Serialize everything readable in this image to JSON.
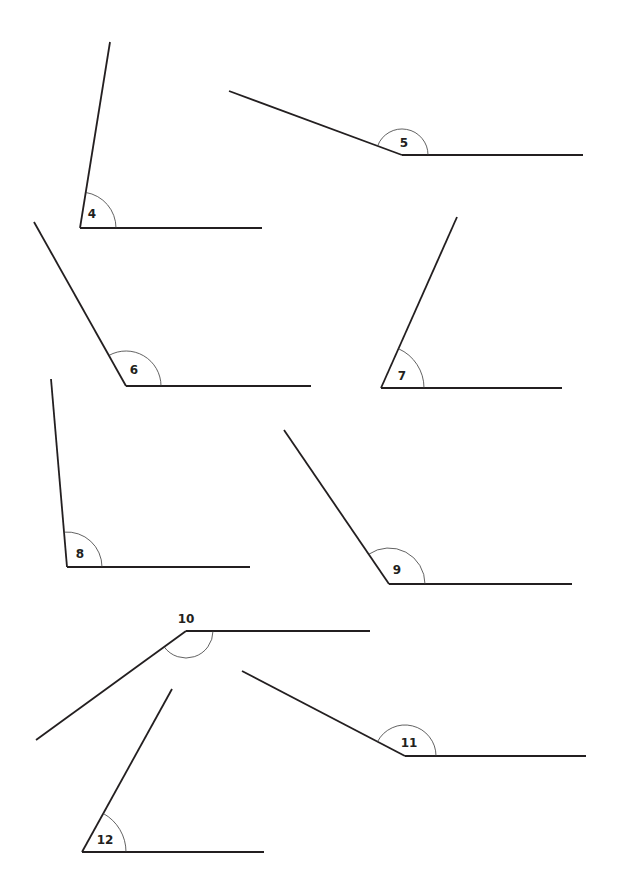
{
  "worksheet": {
    "angles": [
      {
        "label": "4",
        "vertex": [
          80,
          228
        ],
        "ray1_end": [
          110,
          42
        ],
        "ray2_end": [
          262,
          228
        ],
        "arc_radius": 36,
        "label_pos": [
          92,
          218
        ]
      },
      {
        "label": "5",
        "vertex": [
          402,
          155
        ],
        "ray1_end": [
          229,
          91
        ],
        "ray2_end": [
          583,
          155
        ],
        "arc_radius": 26,
        "label_pos": [
          404,
          147
        ]
      },
      {
        "label": "6",
        "vertex": [
          126,
          386
        ],
        "ray1_end": [
          34,
          222
        ],
        "ray2_end": [
          311,
          386
        ],
        "arc_radius": 35,
        "label_pos": [
          134,
          374
        ]
      },
      {
        "label": "7",
        "vertex": [
          381,
          388
        ],
        "ray1_end": [
          457,
          217
        ],
        "ray2_end": [
          562,
          388
        ],
        "arc_radius": 43,
        "label_pos": [
          402,
          380
        ]
      },
      {
        "label": "8",
        "vertex": [
          67,
          567
        ],
        "ray1_end": [
          51,
          379
        ],
        "ray2_end": [
          250,
          567
        ],
        "arc_radius": 35,
        "label_pos": [
          80,
          558
        ]
      },
      {
        "label": "9",
        "vertex": [
          389,
          584
        ],
        "ray1_end": [
          284,
          430
        ],
        "ray2_end": [
          572,
          584
        ],
        "arc_radius": 36,
        "label_pos": [
          397,
          574
        ]
      },
      {
        "label": "10",
        "vertex": [
          186,
          631
        ],
        "ray1_end": [
          36,
          740
        ],
        "ray2_end": [
          370,
          631
        ],
        "arc_radius": 27,
        "label_pos": [
          186,
          623
        ]
      },
      {
        "label": "11",
        "vertex": [
          405,
          756
        ],
        "ray1_end": [
          242,
          671
        ],
        "ray2_end": [
          586,
          756
        ],
        "arc_radius": 31,
        "label_pos": [
          409,
          747
        ]
      },
      {
        "label": "12",
        "vertex": [
          82,
          852
        ],
        "ray1_end": [
          172,
          689
        ],
        "ray2_end": [
          264,
          852
        ],
        "arc_radius": 44,
        "label_pos": [
          105,
          844
        ]
      }
    ]
  }
}
